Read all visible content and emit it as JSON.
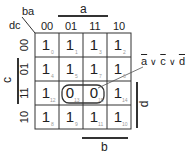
{
  "map": {
    "corner_top": "ba",
    "corner_left": "dc",
    "column_headers": [
      "00",
      "01",
      "11",
      "10"
    ],
    "row_headers": [
      "00",
      "01",
      "11",
      "10"
    ],
    "variable_labels": {
      "a": "a",
      "b": "b",
      "c": "c",
      "d": "d"
    },
    "cells": [
      [
        {
          "value": "1",
          "index": "0"
        },
        {
          "value": "1",
          "index": "1"
        },
        {
          "value": "1",
          "index": "3"
        },
        {
          "value": "1",
          "index": "2"
        }
      ],
      [
        {
          "value": "1",
          "index": "4"
        },
        {
          "value": "1",
          "index": "5"
        },
        {
          "value": "1",
          "index": "7"
        },
        {
          "value": "1",
          "index": "6"
        }
      ],
      [
        {
          "value": "1",
          "index": "12"
        },
        {
          "value": "0",
          "index": "13"
        },
        {
          "value": "0",
          "index": "15"
        },
        {
          "value": "1",
          "index": "14"
        }
      ],
      [
        {
          "value": "1",
          "index": "8"
        },
        {
          "value": "1",
          "index": "9"
        },
        {
          "value": "1",
          "index": "11"
        },
        {
          "value": "1",
          "index": "10"
        }
      ]
    ],
    "group": {
      "cells": [
        "13",
        "15"
      ],
      "expression_parts": [
        "a",
        "∨",
        "c",
        "∨",
        "d"
      ]
    }
  },
  "colors": {
    "line": "#333333",
    "text": "#222222",
    "index_text": "#9a9a9a"
  }
}
